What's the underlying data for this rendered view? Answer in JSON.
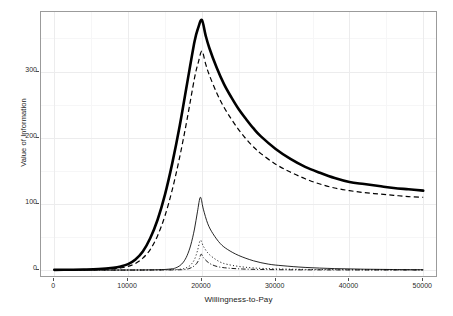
{
  "chart_data": {
    "type": "line",
    "title": "",
    "xlabel": "Willingness-to-Pay",
    "ylabel": "Value of Information",
    "xlim": [
      -1800,
      52000
    ],
    "ylim": [
      -12,
      390
    ],
    "xticks": [
      0,
      10000,
      20000,
      30000,
      40000,
      50000
    ],
    "xtick_labels": [
      "0",
      "10000",
      "20000",
      "30000",
      "40000",
      "50000"
    ],
    "yticks": [
      0,
      100,
      200,
      300
    ],
    "ytick_labels": [
      "0",
      "100",
      "200",
      "300"
    ],
    "grid": true,
    "grid_color": "#ececed",
    "legend": "none",
    "background": "#ffffff",
    "panel_border": "#9b9b9b",
    "series": [
      {
        "name": "EVPI (total)",
        "style": "solid-thick",
        "color": "#000000",
        "linewidth": 2.6,
        "peak_x": 20000,
        "peak_y": 378,
        "x": [
          0,
          2000,
          4000,
          6000,
          8000,
          9000,
          10000,
          11000,
          12000,
          13000,
          14000,
          15000,
          16000,
          17000,
          18000,
          19000,
          19500,
          20000,
          20500,
          21000,
          22000,
          23000,
          24000,
          25000,
          26000,
          27000,
          28000,
          30000,
          32000,
          34000,
          36000,
          38000,
          40000,
          42000,
          44000,
          46000,
          48000,
          50000
        ],
        "y": [
          0.3,
          0.5,
          0.8,
          1.5,
          3.5,
          5.5,
          9,
          16,
          28,
          48,
          76,
          114,
          162,
          218,
          282,
          345,
          366,
          378,
          355,
          336,
          306,
          281,
          261,
          243,
          228,
          214,
          202,
          183,
          168,
          156,
          147,
          139,
          133,
          130,
          127,
          124,
          122,
          120
        ]
      },
      {
        "name": "EVPPI (parameter subset A)",
        "style": "dashed",
        "color": "#000000",
        "linewidth": 1.2,
        "peak_x": 20000,
        "peak_y": 331,
        "x": [
          0,
          2000,
          4000,
          6000,
          8000,
          9000,
          10000,
          11000,
          12000,
          13000,
          14000,
          15000,
          16000,
          17000,
          18000,
          19000,
          19500,
          20000,
          20500,
          21000,
          22000,
          23000,
          24000,
          25000,
          26000,
          27000,
          28000,
          30000,
          32000,
          34000,
          36000,
          38000,
          40000,
          42000,
          44000,
          46000,
          48000,
          50000
        ],
        "y": [
          0.2,
          0.3,
          0.5,
          0.9,
          2,
          3.2,
          5.5,
          10,
          18,
          31,
          52,
          82,
          122,
          171,
          228,
          290,
          313,
          331,
          312,
          295,
          268,
          246,
          228,
          212,
          198,
          186,
          176,
          160,
          148,
          138,
          130,
          124,
          120,
          117,
          115,
          113,
          111,
          110
        ]
      },
      {
        "name": "EVPPI (parameter subset B)",
        "style": "solid-thin",
        "color": "#000000",
        "linewidth": 0.85,
        "peak_x": 19800,
        "peak_y": 110,
        "x": [
          0,
          5000,
          10000,
          12000,
          14000,
          15000,
          16000,
          16500,
          17000,
          17500,
          18000,
          18500,
          19000,
          19400,
          19800,
          20200,
          20800,
          21500,
          22500,
          23500,
          25000,
          27000,
          29000,
          31000,
          34000,
          38000,
          42000,
          46000,
          50000
        ],
        "y": [
          0,
          0,
          0.1,
          0.2,
          0.5,
          0.9,
          2,
          3.5,
          6.5,
          12,
          22,
          38,
          62,
          88,
          110,
          92,
          70,
          55,
          40,
          31,
          22,
          14,
          9,
          6.5,
          4,
          2.2,
          1.3,
          0.8,
          0.5
        ]
      },
      {
        "name": "EVPPI (parameter subset C)",
        "style": "dotted",
        "color": "#000000",
        "linewidth": 0.9,
        "peak_x": 19800,
        "peak_y": 45,
        "x": [
          0,
          8000,
          12000,
          15000,
          16500,
          17500,
          18000,
          18500,
          19000,
          19400,
          19800,
          20200,
          20800,
          21500,
          22500,
          23500,
          25000,
          27000,
          30000,
          34000,
          40000,
          45000,
          50000
        ],
        "y": [
          0,
          0,
          0.1,
          0.3,
          0.8,
          2,
          4,
          8,
          16,
          29,
          45,
          36,
          26,
          19,
          12,
          8.5,
          5.5,
          3.2,
          1.8,
          1,
          0.5,
          0.3,
          0.2
        ]
      },
      {
        "name": "EVPPI (parameter subset D)",
        "style": "dashdot",
        "color": "#000000",
        "linewidth": 0.9,
        "peak_x": 19900,
        "peak_y": 24,
        "x": [
          0,
          10000,
          14000,
          16500,
          17500,
          18200,
          18800,
          19300,
          19650,
          19900,
          20200,
          20700,
          21300,
          22200,
          23500,
          25500,
          28000,
          32000,
          38000,
          44000,
          50000
        ],
        "y": [
          0,
          0,
          0.1,
          0.3,
          0.8,
          2,
          5,
          10,
          17,
          24,
          19,
          13,
          8.5,
          5,
          3,
          1.6,
          0.9,
          0.4,
          0.2,
          0.1,
          0.05
        ]
      }
    ]
  },
  "axes": {
    "x_title": "Willingness-to-Pay",
    "y_title": "Value of Information"
  }
}
